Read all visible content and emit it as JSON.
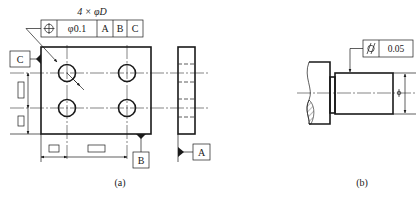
{
  "figure_a": {
    "caption": "(a)",
    "hole_callout": "4 × φD",
    "feature_control_frame": {
      "symbol": "position-icon",
      "tolerance": "φ0.1",
      "datums": [
        "A",
        "B",
        "C"
      ]
    },
    "datum_labels": {
      "A": "A",
      "B": "B",
      "C": "C"
    }
  },
  "figure_b": {
    "caption": "(b)",
    "feature_control_frame": {
      "symbol": "cylindricity-icon",
      "tolerance": "0.05"
    },
    "diameter_symbol": "φ"
  },
  "colors": {
    "line": "#1a1a1a",
    "background": "#ffffff",
    "hatch": "#555555"
  }
}
